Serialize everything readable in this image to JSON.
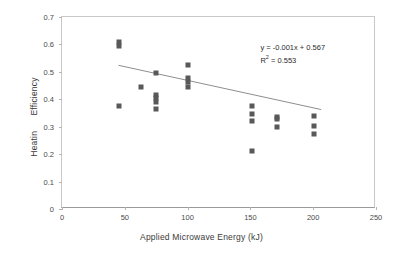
{
  "chart_data": {
    "type": "scatter",
    "title": "",
    "xlabel": "Applied Microwave Energy (kJ)",
    "ylabel": "Heatin      Efficiency",
    "ylabel_full": "Heating Efficiency",
    "xlim": [
      0,
      250
    ],
    "ylim": [
      0,
      0.7
    ],
    "xticks": [
      0,
      50,
      100,
      150,
      200,
      250
    ],
    "yticks": [
      0,
      0.1,
      0.2,
      0.3,
      0.4,
      0.5,
      0.6,
      0.7
    ],
    "xtick_labels": [
      "0",
      "50",
      "100",
      "150",
      "200",
      "250"
    ],
    "ytick_labels": [
      "0",
      "0.1",
      "0.2",
      "0.3",
      "0.4",
      "0.5",
      "0.6",
      "0.7"
    ],
    "grid": false,
    "legend": false,
    "marker_color": "#595959",
    "marker_shape": "square",
    "trendline_color": "#808080",
    "points": [
      {
        "x": 45,
        "y": 0.61
      },
      {
        "x": 45,
        "y": 0.593
      },
      {
        "x": 45,
        "y": 0.377
      },
      {
        "x": 63,
        "y": 0.444
      },
      {
        "x": 75,
        "y": 0.496
      },
      {
        "x": 75,
        "y": 0.416
      },
      {
        "x": 75,
        "y": 0.404
      },
      {
        "x": 75,
        "y": 0.389
      },
      {
        "x": 75,
        "y": 0.366
      },
      {
        "x": 100,
        "y": 0.524
      },
      {
        "x": 100,
        "y": 0.477
      },
      {
        "x": 100,
        "y": 0.463
      },
      {
        "x": 100,
        "y": 0.444
      },
      {
        "x": 151,
        "y": 0.377
      },
      {
        "x": 151,
        "y": 0.348
      },
      {
        "x": 151,
        "y": 0.32
      },
      {
        "x": 151,
        "y": 0.21
      },
      {
        "x": 171,
        "y": 0.336
      },
      {
        "x": 171,
        "y": 0.328
      },
      {
        "x": 171,
        "y": 0.299
      },
      {
        "x": 201,
        "y": 0.338
      },
      {
        "x": 201,
        "y": 0.303
      },
      {
        "x": 201,
        "y": 0.272
      }
    ],
    "trendline": {
      "slope": -0.001,
      "intercept": 0.567,
      "x_start": 45,
      "x_end": 208,
      "r_squared": 0.553
    },
    "annotations": {
      "equation": "y = -0.001x + 0.567",
      "r2_prefix": "R",
      "r2_sup": "2",
      "r2_value": " = 0.553"
    }
  }
}
